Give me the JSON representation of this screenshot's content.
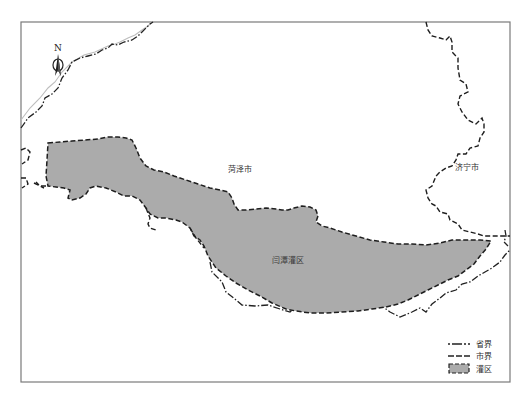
{
  "map": {
    "north_arrow": {
      "label": "N",
      "icon": "north-arrow-icon"
    },
    "labels": {
      "heze": "菏泽市",
      "jining": "济宁市",
      "irrigation_district": "闫潭灌区"
    },
    "legend": {
      "items": [
        {
          "symbol": "dash-dot-line",
          "label": "省界"
        },
        {
          "symbol": "dashed-line",
          "label": "市界"
        },
        {
          "symbol": "gray-fill",
          "label": "灌区"
        }
      ]
    },
    "colors": {
      "district_fill": "#ababab",
      "boundary": "#1e1e1e",
      "frame": "#7a7a7a",
      "background": "#ffffff"
    }
  }
}
